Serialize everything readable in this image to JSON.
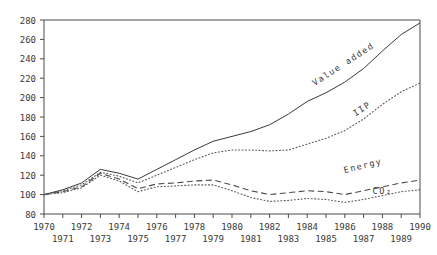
{
  "chart_data": {
    "type": "line",
    "title": "",
    "subtitle": "",
    "xlabel": "",
    "ylabel": "",
    "index_base": "1970 = 100",
    "x": [
      1970,
      1971,
      1972,
      1973,
      1974,
      1975,
      1976,
      1977,
      1978,
      1979,
      1980,
      1981,
      1982,
      1983,
      1984,
      1985,
      1986,
      1987,
      1988,
      1989,
      1990
    ],
    "xlim": [
      1970,
      1990
    ],
    "ylim": [
      80,
      280
    ],
    "xticks": [
      1970,
      1971,
      1972,
      1973,
      1974,
      1975,
      1976,
      1977,
      1978,
      1979,
      1980,
      1981,
      1982,
      1983,
      1984,
      1985,
      1986,
      1987,
      1988,
      1989,
      1990
    ],
    "xtick_labels_row1": [
      "1970",
      "1972",
      "1974",
      "1976",
      "1978",
      "1980",
      "1982",
      "1984",
      "1986",
      "1988",
      "1990"
    ],
    "xtick_labels_row2": [
      "1971",
      "1973",
      "1975",
      "1977",
      "1979",
      "1981",
      "1983",
      "1985",
      "1987",
      "1989"
    ],
    "yticks": [
      80,
      100,
      120,
      140,
      160,
      180,
      200,
      220,
      240,
      260,
      280
    ],
    "ytick_labels": [
      "80",
      "100",
      "120",
      "140",
      "160",
      "180",
      "200",
      "220",
      "240",
      "260",
      "280"
    ],
    "grid": false,
    "legend_position": "inline-annotations",
    "series": [
      {
        "name": "Value added",
        "label": "Value added",
        "style": "solid",
        "color": "#3a3a3a",
        "values": [
          100,
          105,
          112,
          126,
          122,
          116,
          126,
          136,
          146,
          155,
          160,
          165,
          172,
          183,
          196,
          205,
          216,
          230,
          248,
          265,
          277
        ],
        "annotation": {
          "text": "Value added",
          "x": 1986,
          "y": 232,
          "rotation": -33
        }
      },
      {
        "name": "IIP",
        "label": "IIP",
        "style": "dotted",
        "color": "#5a5a5a",
        "values": [
          100,
          104,
          110,
          123,
          119,
          112,
          120,
          128,
          136,
          143,
          146,
          146,
          145,
          146,
          152,
          158,
          166,
          178,
          193,
          206,
          215
        ],
        "annotation": {
          "text": "IIP",
          "x": 1987,
          "y": 186,
          "rotation": -33
        }
      },
      {
        "name": "Energy",
        "label": "Energy",
        "style": "dashed",
        "color": "#4a4a4a",
        "values": [
          100,
          103,
          108,
          122,
          116,
          106,
          111,
          112,
          114,
          115,
          110,
          104,
          100,
          102,
          104,
          103,
          100,
          104,
          108,
          112,
          115
        ],
        "annotation": {
          "text": "Energy",
          "x": 1987,
          "y": 127,
          "rotation": -14
        }
      },
      {
        "name": "CO2",
        "label": "CO₂",
        "style": "dotted",
        "color": "#5a5a5a",
        "values": [
          100,
          102,
          107,
          120,
          114,
          103,
          108,
          109,
          110,
          110,
          104,
          97,
          93,
          94,
          96,
          95,
          92,
          95,
          99,
          103,
          105
        ],
        "annotation": {
          "text": "CO₂",
          "x": 1988,
          "y": 101,
          "rotation": 0
        }
      }
    ]
  },
  "axes": {
    "frame_color": "#4a4a4a",
    "tick_color": "#4a4a4a"
  }
}
